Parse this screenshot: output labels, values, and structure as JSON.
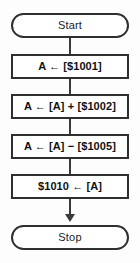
{
  "diagram": {
    "type": "flowchart",
    "background_color": "#fdfdfd",
    "line_color": "#3a3a3a",
    "shape_border_color": "#2f2f2f",
    "shape_fill_color": "#ffffff",
    "text_color": "#111111",
    "nodes": [
      {
        "id": "start",
        "shape": "terminal",
        "label": "Start"
      },
      {
        "id": "load",
        "shape": "process",
        "label": "A ← [$1001]"
      },
      {
        "id": "add",
        "shape": "process",
        "label": "A ← [A] + [$1002]"
      },
      {
        "id": "subtract",
        "shape": "process",
        "label": "A ← [A] − [$1005]"
      },
      {
        "id": "store",
        "shape": "process",
        "label": "$1010 ← [A]"
      },
      {
        "id": "stop",
        "shape": "terminal",
        "label": "Stop"
      }
    ],
    "edges": [
      {
        "from": "start",
        "to": "load",
        "arrowhead": false
      },
      {
        "from": "load",
        "to": "add",
        "arrowhead": false
      },
      {
        "from": "add",
        "to": "subtract",
        "arrowhead": false
      },
      {
        "from": "subtract",
        "to": "store",
        "arrowhead": false
      },
      {
        "from": "store",
        "to": "stop",
        "arrowhead": true
      }
    ]
  }
}
